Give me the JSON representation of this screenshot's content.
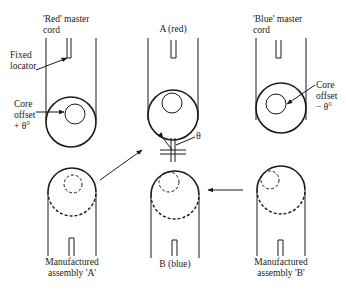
{
  "labels": {
    "red_master_cord": [
      "'Red' master",
      "cord"
    ],
    "fixed_locator": [
      "Fixed",
      "locator"
    ],
    "core_offset_plus": [
      "Core",
      "offset",
      "+ θ°"
    ],
    "a_red": "A (red)",
    "blue_master_cord": [
      "'Blue' master",
      "cord"
    ],
    "core_offset_minus": [
      "Core",
      "offset",
      "− θ°"
    ],
    "theta": "θ",
    "assembly_a": [
      "Manufactured",
      "assembly 'A'"
    ],
    "b_blue": "B (blue)",
    "assembly_b": [
      "Manufactured",
      "assembly 'B'"
    ]
  },
  "colors": {
    "line": "#1a1a1a",
    "background": "#ffffff"
  }
}
